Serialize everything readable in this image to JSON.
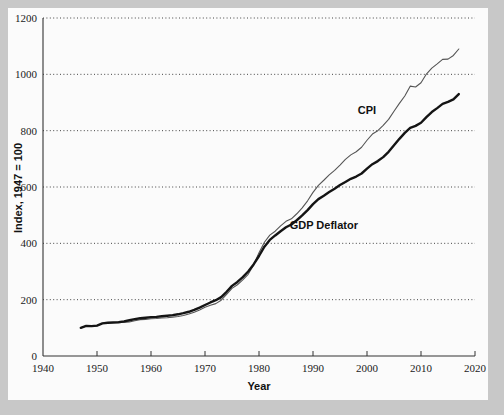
{
  "chart_data": {
    "type": "line",
    "title": "",
    "xlabel": "Year",
    "ylabel": "Index, 1947 = 100",
    "xlim": [
      1940,
      2020
    ],
    "ylim": [
      0,
      1200
    ],
    "xticks": [
      1940,
      1950,
      1960,
      1970,
      1980,
      1990,
      2000,
      2010,
      2020
    ],
    "xtick_labels": [
      "1940",
      "1950",
      "1960",
      "1970",
      "1980",
      "1990",
      "2000",
      "2010",
      "2020"
    ],
    "yticks": [
      0,
      200,
      400,
      600,
      800,
      1000,
      1200
    ],
    "ytick_labels": [
      "0",
      "200",
      "400",
      "600",
      "800",
      "1000",
      "1200"
    ],
    "grid": "horizontal-dotted",
    "legend": "inline-annotations",
    "annotations": [
      {
        "text": "CPI",
        "x": 2000,
        "y": 860
      },
      {
        "text": "GDP Deflator",
        "x": 1992,
        "y": 450
      }
    ],
    "series": [
      {
        "name": "CPI",
        "color": "#555555",
        "width": 1.1,
        "x": [
          1947,
          1948,
          1949,
          1950,
          1951,
          1952,
          1953,
          1954,
          1955,
          1956,
          1957,
          1958,
          1959,
          1960,
          1961,
          1962,
          1963,
          1964,
          1965,
          1966,
          1967,
          1968,
          1969,
          1970,
          1971,
          1972,
          1973,
          1974,
          1975,
          1976,
          1977,
          1978,
          1979,
          1980,
          1981,
          1982,
          1983,
          1984,
          1985,
          1986,
          1987,
          1988,
          1989,
          1990,
          1991,
          1992,
          1993,
          1994,
          1995,
          1996,
          1997,
          1998,
          1999,
          2000,
          2001,
          2002,
          2003,
          2004,
          2005,
          2006,
          2007,
          2008,
          2009,
          2010,
          2011,
          2012,
          2013,
          2014,
          2015,
          2016,
          2017
        ],
        "values": [
          100,
          107,
          106,
          107,
          116,
          118,
          119,
          120,
          119,
          121,
          125,
          129,
          130,
          132,
          133,
          135,
          136,
          138,
          140,
          144,
          149,
          155,
          163,
          173,
          180,
          186,
          198,
          219,
          240,
          253,
          270,
          290,
          323,
          367,
          404,
          429,
          443,
          462,
          478,
          487,
          505,
          526,
          551,
          581,
          606,
          624,
          643,
          659,
          678,
          698,
          714,
          725,
          741,
          766,
          788,
          800,
          819,
          840,
          869,
          897,
          923,
          958,
          955,
          970,
          1001,
          1022,
          1037,
          1053,
          1054,
          1067,
          1090
        ],
        "ylim_note": "1947 = 100"
      },
      {
        "name": "GDP Deflator",
        "color": "#141414",
        "width": 2.4,
        "x": [
          1947,
          1948,
          1949,
          1950,
          1951,
          1952,
          1953,
          1954,
          1955,
          1956,
          1957,
          1958,
          1959,
          1960,
          1961,
          1962,
          1963,
          1964,
          1965,
          1966,
          1967,
          1968,
          1969,
          1970,
          1971,
          1972,
          1973,
          1974,
          1975,
          1976,
          1977,
          1978,
          1979,
          1980,
          1981,
          1982,
          1983,
          1984,
          1985,
          1986,
          1987,
          1988,
          1989,
          1990,
          1991,
          1992,
          1993,
          1994,
          1995,
          1996,
          1997,
          1998,
          1999,
          2000,
          2001,
          2002,
          2003,
          2004,
          2005,
          2006,
          2007,
          2008,
          2009,
          2010,
          2011,
          2012,
          2013,
          2014,
          2015,
          2016,
          2017
        ],
        "values": [
          100,
          107,
          106,
          108,
          116,
          118,
          119,
          120,
          123,
          127,
          131,
          134,
          136,
          138,
          139,
          141,
          143,
          145,
          148,
          152,
          157,
          164,
          172,
          181,
          190,
          198,
          209,
          228,
          249,
          263,
          280,
          300,
          325,
          355,
          388,
          412,
          428,
          443,
          457,
          467,
          482,
          499,
          518,
          539,
          557,
          569,
          582,
          594,
          607,
          618,
          629,
          637,
          648,
          665,
          681,
          692,
          706,
          725,
          748,
          771,
          792,
          810,
          817,
          828,
          848,
          866,
          880,
          895,
          902,
          911,
          930
        ]
      }
    ]
  },
  "figure": {
    "background": "#fbfbfb",
    "border_color": "#c8c8c8",
    "axis_color": "#333333",
    "grid_color": "#444444"
  }
}
